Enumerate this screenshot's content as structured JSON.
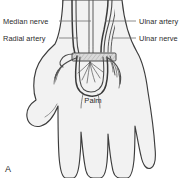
{
  "figure": {
    "panel_label": "A",
    "caption_region": "palmar-hand-vasculature-nerves",
    "labels": {
      "median_nerve": "Median nerve",
      "radial_artery": "Radial artery",
      "ulnar_artery": "Ulnar artery",
      "ulnar_nerve": "Ulnar nerve",
      "palm": "Palm"
    },
    "colors": {
      "background": "#ffffff",
      "skin_fill": "#f2f2f2",
      "forearm_fill": "#ededed",
      "outline": "#3c3c3c",
      "vessel": "#3a3a3a",
      "nerve": "#5a5a5a",
      "leader_line": "#6e6e6e",
      "text": "#2b2b2b",
      "retinaculum_fill": "#d9d9d9"
    },
    "structures": [
      "median nerve",
      "radial artery",
      "ulnar artery",
      "ulnar nerve",
      "superficial palmar arch",
      "flexor retinaculum",
      "digital branches",
      "thumb",
      "palm"
    ]
  }
}
